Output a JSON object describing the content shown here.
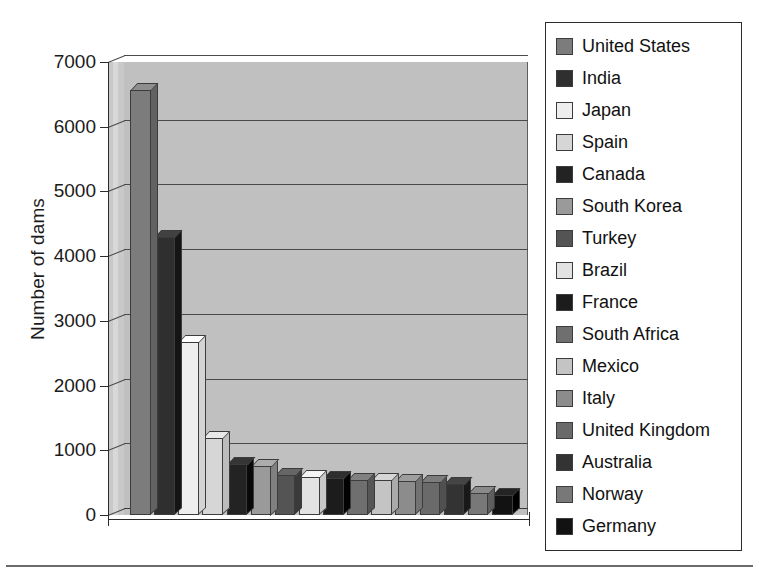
{
  "chart_data": {
    "type": "bar",
    "title": "",
    "subtitle": "",
    "xlabel": "",
    "ylabel": "Number of dams",
    "ylim": [
      0,
      7000
    ],
    "ytick_step": 1000,
    "ytick_labels": [
      "7000",
      "6000",
      "5000",
      "4000",
      "3000",
      "2000",
      "1000",
      "0"
    ],
    "ytick_values": [
      7000,
      6000,
      5000,
      4000,
      3000,
      2000,
      1000,
      0
    ],
    "grid": true,
    "legend_position": "right",
    "style": "3d-column",
    "categories": [
      "United States",
      "India",
      "Japan",
      "Spain",
      "Canada",
      "South Korea",
      "Turkey",
      "Brazil",
      "France",
      "South Africa",
      "Mexico",
      "Italy",
      "United Kingdom",
      "Australia",
      "Norway",
      "Germany"
    ],
    "values": [
      6575,
      4300,
      2675,
      1196,
      793,
      765,
      625,
      594,
      569,
      539,
      537,
      524,
      517,
      486,
      335,
      311
    ],
    "series": [
      {
        "name": "Number of dams",
        "values": [
          6575,
          4300,
          2675,
          1196,
          793,
          765,
          625,
          594,
          569,
          539,
          537,
          524,
          517,
          486,
          335,
          311
        ]
      }
    ],
    "colors": [
      "#7c7c7c",
      "#2f2f2f",
      "#eeeeee",
      "#d6d6d6",
      "#232323",
      "#9a9a9a",
      "#545454",
      "#e2e2e2",
      "#1c1c1c",
      "#6f6f6f",
      "#c4c4c4",
      "#8c8c8c",
      "#6a6a6a",
      "#333333",
      "#787878",
      "#121212"
    ]
  },
  "legend": {
    "items": [
      {
        "label": "United States",
        "color": "#7c7c7c"
      },
      {
        "label": "India",
        "color": "#2f2f2f"
      },
      {
        "label": "Japan",
        "color": "#eeeeee"
      },
      {
        "label": "Spain",
        "color": "#d6d6d6"
      },
      {
        "label": "Canada",
        "color": "#232323"
      },
      {
        "label": "South Korea",
        "color": "#9a9a9a"
      },
      {
        "label": "Turkey",
        "color": "#545454"
      },
      {
        "label": "Brazil",
        "color": "#e2e2e2"
      },
      {
        "label": "France",
        "color": "#1c1c1c"
      },
      {
        "label": "South Africa",
        "color": "#6f6f6f"
      },
      {
        "label": "Mexico",
        "color": "#c4c4c4"
      },
      {
        "label": "Italy",
        "color": "#8c8c8c"
      },
      {
        "label": "United Kingdom",
        "color": "#6a6a6a"
      },
      {
        "label": "Australia",
        "color": "#333333"
      },
      {
        "label": "Norway",
        "color": "#787878"
      },
      {
        "label": "Germany",
        "color": "#121212"
      }
    ]
  },
  "axis": {
    "y_title": "Number of dams"
  }
}
